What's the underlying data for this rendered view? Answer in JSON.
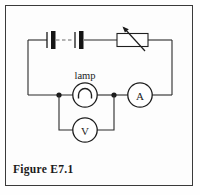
{
  "figure": {
    "caption": "Figure E7.1",
    "border_color": "#3a3a3a",
    "background_color": "#fdfdfd",
    "wire_color": "#2b2b2b",
    "width": 200,
    "height": 195
  },
  "circuit": {
    "title": "Figure E7.1",
    "type": "electrical-schematic",
    "components": [
      {
        "id": "battery",
        "name": "battery",
        "symbol": "multi-cell-battery",
        "label": "",
        "cells": 2,
        "dashed_link": true,
        "position": "top-left"
      },
      {
        "id": "rheostat",
        "name": "variable-resistor",
        "symbol": "rheostat-arrow-box",
        "label": "",
        "position": "top-right"
      },
      {
        "id": "lamp",
        "name": "lamp",
        "symbol": "lamp-circle-arch",
        "label": "lamp",
        "position": "middle-center"
      },
      {
        "id": "ammeter",
        "name": "ammeter",
        "symbol": "circle-meter",
        "label": "A",
        "position": "middle-right"
      },
      {
        "id": "voltmeter",
        "name": "voltmeter",
        "symbol": "circle-meter",
        "label": "V",
        "position": "bottom-center"
      }
    ],
    "junctions": 2,
    "labels": {
      "lamp": "lamp",
      "ammeter": "A",
      "voltmeter": "V"
    }
  }
}
